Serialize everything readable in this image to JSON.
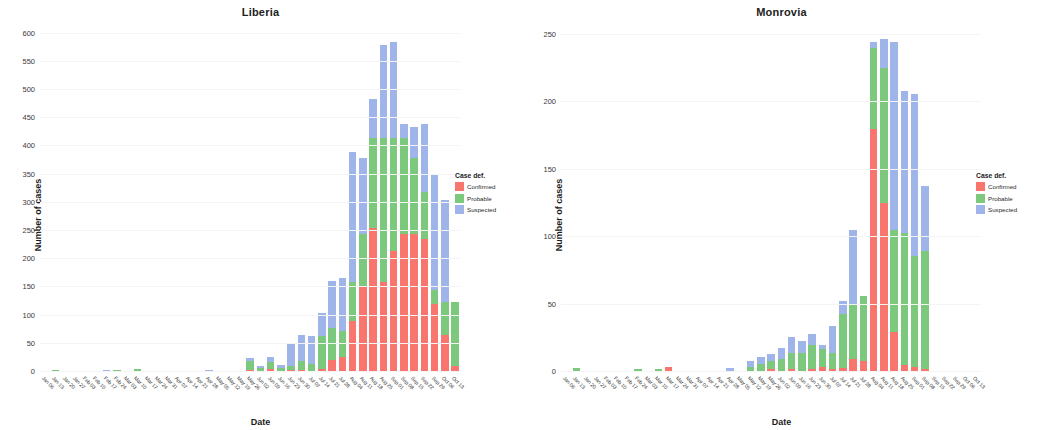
{
  "chart_data": [
    {
      "type": "bar",
      "title": "Liberia",
      "xlabel": "Date",
      "ylabel": "Number of cases",
      "ylim": [
        0,
        610
      ],
      "yticks": [
        0,
        50,
        100,
        150,
        200,
        250,
        300,
        350,
        400,
        450,
        500,
        550,
        600
      ],
      "grid": true,
      "stacked": true,
      "legend": {
        "title": "Case def.",
        "position": "right",
        "entries": [
          "Confirmed",
          "Probable",
          "Suspected"
        ]
      },
      "colors": {
        "Confirmed": "#F8766D",
        "Probable": "#7CC87C",
        "Suspected": "#9FB4E8"
      },
      "categories": [
        "Jan 06",
        "Jan 13",
        "Jan 20",
        "Jan 27",
        "Feb 03",
        "Feb 10",
        "Feb 17",
        "Feb 24",
        "Mar 03",
        "Mar 10",
        "Mar 17",
        "Mar 24",
        "Mar 31",
        "Apr 07",
        "Apr 14",
        "Apr 21",
        "Apr 28",
        "May 05",
        "May 12",
        "May 19",
        "May 26",
        "Jun 02",
        "Jun 09",
        "Jun 16",
        "Jun 23",
        "Jun 30",
        "Jul 07",
        "Jul 14",
        "Jul 21",
        "Jul 28",
        "Aug 04",
        "Aug 11",
        "Aug 18",
        "Aug 25",
        "Sep 01",
        "Sep 08",
        "Sep 15",
        "Sep 22",
        "Sep 29",
        "Oct 06",
        "Oct 13"
      ],
      "series": [
        {
          "name": "Confirmed",
          "values": [
            0,
            0,
            0,
            0,
            0,
            0,
            0,
            0,
            0,
            0,
            0,
            0,
            0,
            0,
            0,
            0,
            0,
            0,
            0,
            0,
            4,
            2,
            5,
            2,
            3,
            4,
            2,
            5,
            22,
            27,
            90,
            150,
            255,
            160,
            215,
            245,
            245,
            235,
            120,
            65,
            10
          ]
        },
        {
          "name": "Probable",
          "values": [
            0,
            3,
            0,
            0,
            0,
            0,
            0,
            3,
            2,
            6,
            0,
            0,
            0,
            0,
            0,
            0,
            0,
            0,
            0,
            0,
            16,
            5,
            12,
            6,
            8,
            16,
            12,
            58,
            56,
            45,
            70,
            95,
            160,
            255,
            200,
            170,
            135,
            85,
            25,
            60,
            115
          ]
        },
        {
          "name": "Suspected",
          "values": [
            0,
            0,
            0,
            0,
            0,
            0,
            4,
            0,
            0,
            0,
            0,
            0,
            0,
            0,
            0,
            0,
            4,
            0,
            0,
            0,
            5,
            4,
            9,
            4,
            40,
            45,
            50,
            42,
            84,
            95,
            230,
            135,
            70,
            165,
            170,
            25,
            55,
            120,
            205,
            180,
            0
          ]
        }
      ]
    },
    {
      "type": "bar",
      "title": "Monrovia",
      "xlabel": "Date",
      "ylabel": "Number of cases",
      "ylim": [
        0,
        255
      ],
      "yticks": [
        0,
        50,
        100,
        150,
        200,
        250
      ],
      "grid": true,
      "stacked": true,
      "legend": {
        "title": "Case def.",
        "position": "right",
        "entries": [
          "Confirmed",
          "Probable",
          "Suspected"
        ]
      },
      "colors": {
        "Confirmed": "#F8766D",
        "Probable": "#7CC87C",
        "Suspected": "#9FB4E8"
      },
      "categories": [
        "Jan 06",
        "Jan 13",
        "Jan 20",
        "Jan 27",
        "Feb 03",
        "Feb 10",
        "Feb 17",
        "Feb 24",
        "Mar 03",
        "Mar 10",
        "Mar 17",
        "Mar 24",
        "Mar 31",
        "Apr 07",
        "Apr 14",
        "Apr 21",
        "Apr 28",
        "May 05",
        "May 12",
        "May 19",
        "May 26",
        "Jun 02",
        "Jun 09",
        "Jun 16",
        "Jun 23",
        "Jun 30",
        "Jul 07",
        "Jul 14",
        "Jul 21",
        "Jul 28",
        "Aug 04",
        "Aug 11",
        "Aug 18",
        "Aug 25",
        "Sep 01",
        "Sep 08",
        "Sep 15",
        "Sep 22",
        "Sep 29",
        "Oct 06",
        "Oct 13"
      ],
      "series": [
        {
          "name": "Confirmed",
          "values": [
            0,
            0,
            0,
            0,
            0,
            0,
            0,
            0,
            0,
            0,
            4,
            0,
            0,
            0,
            0,
            0,
            0,
            0,
            1,
            1,
            2,
            1,
            2,
            1,
            2,
            4,
            2,
            3,
            10,
            8,
            180,
            125,
            30,
            5,
            4,
            2,
            0,
            0,
            0,
            0,
            0
          ]
        },
        {
          "name": "Probable",
          "values": [
            0,
            3,
            0,
            0,
            0,
            0,
            0,
            2,
            0,
            2,
            0,
            0,
            0,
            0,
            0,
            0,
            0,
            0,
            3,
            5,
            6,
            9,
            12,
            13,
            18,
            13,
            12,
            40,
            40,
            48,
            60,
            100,
            75,
            98,
            82,
            88,
            0,
            0,
            0,
            0,
            0
          ]
        },
        {
          "name": "Suspected",
          "values": [
            0,
            0,
            0,
            0,
            0,
            0,
            0,
            0,
            0,
            0,
            0,
            0,
            0,
            0,
            0,
            0,
            3,
            0,
            4,
            5,
            5,
            8,
            12,
            9,
            8,
            3,
            20,
            10,
            55,
            0,
            5,
            22,
            140,
            105,
            120,
            48,
            0,
            0,
            0,
            0,
            0
          ]
        }
      ]
    }
  ]
}
